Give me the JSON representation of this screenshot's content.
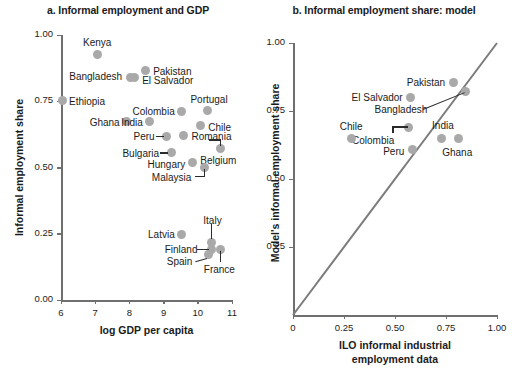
{
  "figure": {
    "panel_a_title": "a. Informal employment and GDP",
    "panel_b_title": "b. Informal employment share: model"
  },
  "chart_data": [
    {
      "type": "scatter",
      "panel": "a",
      "title": "a. Informal employment and GDP",
      "xlabel": "log GDP per capita",
      "ylabel": "Informal employment share",
      "xlim": [
        6,
        11
      ],
      "ylim": [
        0.0,
        1.0
      ],
      "xticks": [
        "6",
        "7",
        "8",
        "9",
        "10",
        "11"
      ],
      "yticks": [
        "0.00",
        "0.25",
        "0.50",
        "0.75",
        "1.00"
      ],
      "grid": false,
      "legend": "none",
      "marker_color": "#a9a9a9",
      "points": [
        {
          "label": "Kenya",
          "x": 7.06,
          "y": 0.925,
          "label_pos": "above"
        },
        {
          "label": "Bangladesh",
          "x": 8.02,
          "y": 0.84,
          "label_pos": "left"
        },
        {
          "label": "Pakistan",
          "x": 8.46,
          "y": 0.865,
          "label_pos": "right"
        },
        {
          "label": "El Salvador",
          "x": 8.14,
          "y": 0.838,
          "label_pos": "right"
        },
        {
          "label": "Ethiopia",
          "x": 6.03,
          "y": 0.752,
          "label_pos": "right"
        },
        {
          "label": "Portugal",
          "x": 10.27,
          "y": 0.715,
          "label_pos": "above"
        },
        {
          "label": "Colombia",
          "x": 9.53,
          "y": 0.712,
          "label_pos": "left"
        },
        {
          "label": "Ghana",
          "x": 7.92,
          "y": 0.672,
          "label_pos": "left"
        },
        {
          "label": "India",
          "x": 8.6,
          "y": 0.672,
          "label_pos": "left"
        },
        {
          "label": "Chile",
          "x": 10.07,
          "y": 0.66,
          "label_pos": "right"
        },
        {
          "label": "Peru",
          "x": 9.09,
          "y": 0.617,
          "label_pos": "left"
        },
        {
          "label": "Romania",
          "x": 9.58,
          "y": 0.62,
          "label_pos": "right"
        },
        {
          "label": "Belgium",
          "x": 10.66,
          "y": 0.572,
          "label_pos": "below"
        },
        {
          "label": "Bulgaria",
          "x": 9.22,
          "y": 0.556,
          "label_pos": "left"
        },
        {
          "label": "Hungary",
          "x": 9.84,
          "y": 0.518,
          "label_pos": "left"
        },
        {
          "label": "Malaysia",
          "x": 10.19,
          "y": 0.5,
          "label_pos": "left"
        },
        {
          "label": "Latvia",
          "x": 9.53,
          "y": 0.248,
          "label_pos": "left"
        },
        {
          "label": "Italy",
          "x": 10.4,
          "y": 0.218,
          "label_pos": "above"
        },
        {
          "label": "France",
          "x": 10.66,
          "y": 0.192,
          "label_pos": "below"
        },
        {
          "label": "Finland",
          "x": 10.4,
          "y": 0.192,
          "label_pos": "left"
        },
        {
          "label": "Spain",
          "x": 10.31,
          "y": 0.17,
          "label_pos": "left"
        }
      ]
    },
    {
      "type": "scatter",
      "panel": "b",
      "title": "b. Informal employment share: model",
      "xlabel": "ILO informal industrial employment data",
      "ylabel": "Model's informal employment share",
      "xlim": [
        0.0,
        1.0
      ],
      "ylim": [
        0.0,
        1.0
      ],
      "xticks": [
        "0",
        "0.25",
        "0.50",
        "0.75",
        "1.00"
      ],
      "yticks": [
        "0.25",
        "0.50",
        "0.75",
        "1.00"
      ],
      "grid": false,
      "legend": "none",
      "marker_color": "#a9a9a9",
      "reference_line": {
        "type": "45-degree",
        "from": [
          0,
          0
        ],
        "to": [
          1.0,
          1.0
        ],
        "color": "#7b7b7b"
      },
      "points": [
        {
          "label": "Pakistan",
          "x": 0.785,
          "y": 0.855,
          "label_pos": "left"
        },
        {
          "label": "Bangladesh",
          "x": 0.845,
          "y": 0.82,
          "label_pos": "leader-left"
        },
        {
          "label": "El Salvador",
          "x": 0.577,
          "y": 0.8,
          "label_pos": "left"
        },
        {
          "label": "Colombia",
          "x": 0.565,
          "y": 0.69,
          "label_pos": "leader-below"
        },
        {
          "label": "Chile",
          "x": 0.285,
          "y": 0.65,
          "label_pos": "above"
        },
        {
          "label": "India",
          "x": 0.73,
          "y": 0.648,
          "label_pos": "above"
        },
        {
          "label": "Ghana",
          "x": 0.81,
          "y": 0.648,
          "label_pos": "below"
        },
        {
          "label": "Peru",
          "x": 0.585,
          "y": 0.608,
          "label_pos": "left"
        }
      ]
    }
  ]
}
